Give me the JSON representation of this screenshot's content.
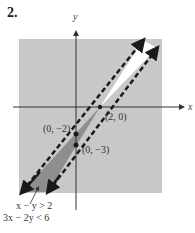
{
  "problem": {
    "number": "2."
  },
  "axes": {
    "x_label": "x",
    "y_label": "y"
  },
  "points": [
    {
      "label": "(2, 0)",
      "x": 2,
      "y": 0
    },
    {
      "label": "(0, −2)",
      "x": 0,
      "y": -2
    },
    {
      "label": "(0, −3)",
      "x": 0,
      "y": -3
    }
  ],
  "lines": [
    {
      "equation": "x − y = 2",
      "style": "dashed"
    },
    {
      "equation": "3x − 2y = 6",
      "style": "dashed"
    }
  ],
  "annotation": {
    "inequality_1": "x − y > 2",
    "inequality_2": "3x − 2y < 6"
  },
  "colors": {
    "background_shade": "#c8c8c8",
    "solution_region": "#8e8e8e",
    "unshaded_region": "#ffffff",
    "line": "#1a1a1a",
    "axis": "#333333"
  }
}
